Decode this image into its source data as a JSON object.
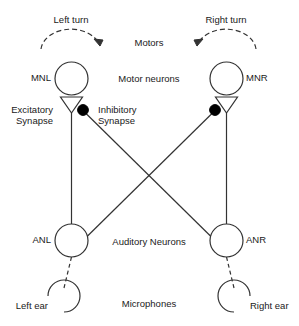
{
  "diagram": {
    "stroke_color": "#333333",
    "fill_color": "#000000",
    "background": "#ffffff"
  },
  "motors": {
    "section_label": "Motors",
    "left_turn_label": "Left turn",
    "right_turn_label": "Right turn"
  },
  "motor_neurons": {
    "section_label": "Motor neurons",
    "left_label": "MNL",
    "right_label": "MNR"
  },
  "synapses": {
    "excitatory_label_line1": "Excitatory",
    "excitatory_label_line2": "Synapse",
    "inhibitory_label_line1": "Inhibitory",
    "inhibitory_label_line2": "Synapse"
  },
  "auditory_neurons": {
    "section_label": "Auditory Neurons",
    "left_label": "ANL",
    "right_label": "ANR"
  },
  "microphones": {
    "section_label": "Microphones",
    "left_label": "Left ear",
    "right_label": "Right ear"
  }
}
